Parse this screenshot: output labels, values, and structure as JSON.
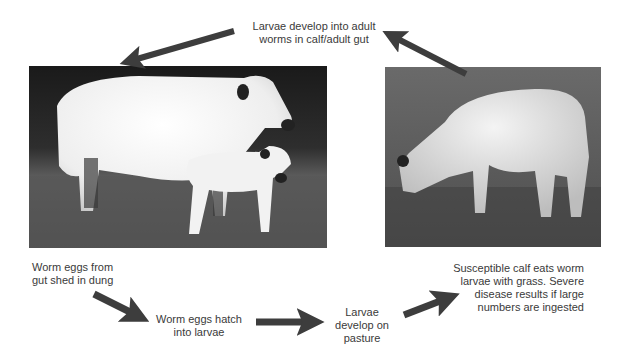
{
  "diagram": {
    "steps": [
      {
        "id": "adult-worms",
        "text": [
          "Larvae develop into adult",
          "worms in calf/adult gut"
        ]
      },
      {
        "id": "eggs-shed",
        "text": [
          "Worm eggs from",
          "gut shed in dung"
        ]
      },
      {
        "id": "eggs-hatch",
        "text": [
          "Worm eggs hatch",
          "into larvae"
        ]
      },
      {
        "id": "larvae-pasture",
        "text": [
          "Larvae",
          "develop on",
          "pasture"
        ]
      },
      {
        "id": "calf-eats",
        "text": [
          "Susceptible calf eats worm",
          "larvae with grass. Severe",
          "disease results if large",
          "numbers are ingested"
        ]
      }
    ],
    "images": [
      {
        "id": "cow-and-calf",
        "description": "White cow standing with white calf on grass, dark background"
      },
      {
        "id": "grazing-calf",
        "description": "White calf grazing on pasture"
      }
    ],
    "arrow_color": "#3d3d3d"
  }
}
